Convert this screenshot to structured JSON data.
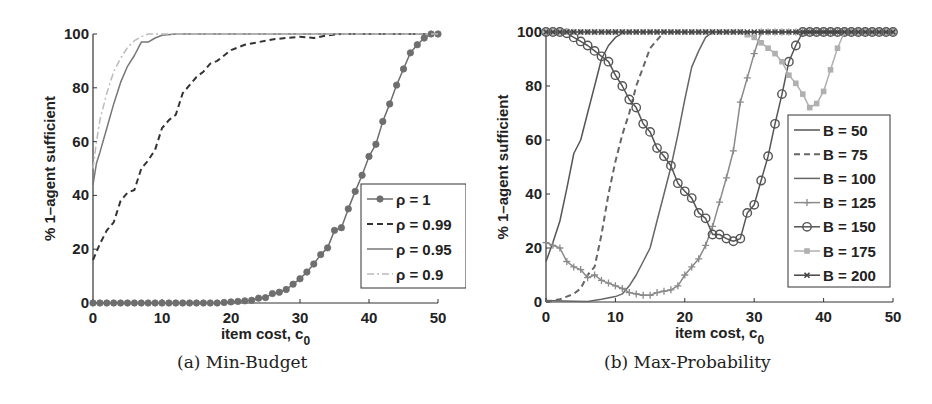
{
  "figure": {
    "panels": [
      {
        "caption": "(a) Min-Budget"
      },
      {
        "caption": "(b) Max-Probability"
      }
    ]
  },
  "chart_data": [
    {
      "type": "line",
      "title": "(a) Min-Budget",
      "xlabel": "item cost, c0",
      "xlabel_main": "item cost, c",
      "xlabel_sub": "0",
      "ylabel": "% 1–agent sufficient",
      "xlim": [
        0,
        50
      ],
      "ylim": [
        0,
        100
      ],
      "xticks": [
        0,
        10,
        20,
        30,
        40,
        50
      ],
      "yticks": [
        0,
        20,
        40,
        60,
        80,
        100
      ],
      "grid": false,
      "legend_position": "lower right",
      "series": [
        {
          "name": "ρ = 1",
          "style": "solid-dot",
          "color": "#6e6e6e",
          "x": [
            0,
            1,
            2,
            3,
            4,
            5,
            6,
            7,
            8,
            9,
            10,
            11,
            12,
            13,
            14,
            15,
            16,
            17,
            18,
            19,
            20,
            21,
            22,
            23,
            24,
            25,
            26,
            27,
            28,
            29,
            30,
            31,
            32,
            33,
            34,
            35,
            36,
            37,
            38,
            39,
            40,
            41,
            42,
            43,
            44,
            45,
            46,
            47,
            48,
            49,
            50
          ],
          "y": [
            0,
            0,
            0,
            0,
            0,
            0,
            0,
            0,
            0,
            0,
            0,
            0,
            0,
            0,
            0,
            0,
            0,
            0,
            0,
            0.2,
            0.4,
            0.6,
            0.8,
            1,
            1.8,
            2,
            3.5,
            4,
            5,
            7,
            9,
            11.5,
            14.5,
            18,
            20.5,
            27,
            28,
            35,
            41.5,
            47.5,
            54.5,
            59,
            67.5,
            74,
            81,
            87,
            93,
            96,
            98.5,
            100,
            100
          ]
        },
        {
          "name": "ρ = 0.99",
          "style": "dashed",
          "color": "#333333",
          "x": [
            0,
            1,
            2,
            3,
            4,
            5,
            6,
            7,
            8,
            9,
            10,
            11,
            12,
            13,
            14,
            15,
            16,
            17,
            18,
            19,
            20,
            22,
            24,
            26,
            28,
            30,
            32,
            34,
            36,
            40,
            45,
            50
          ],
          "y": [
            16,
            22,
            27,
            30,
            38,
            41,
            42,
            50,
            53,
            57,
            65,
            68,
            70,
            78,
            81,
            84,
            86,
            89,
            90,
            92,
            94,
            96,
            97,
            98,
            98.5,
            99,
            98.5,
            99.5,
            100,
            100,
            100,
            100
          ]
        },
        {
          "name": "ρ = 0.95",
          "style": "solid",
          "color": "#777777",
          "x": [
            0,
            0.5,
            1,
            2,
            3,
            4,
            5,
            6,
            7,
            8,
            9,
            10,
            12,
            15,
            20,
            30,
            40,
            50
          ],
          "y": [
            44,
            52,
            56,
            65,
            74,
            82,
            88,
            92,
            97,
            97,
            98.5,
            99.5,
            100,
            100,
            100,
            100,
            100,
            100
          ]
        },
        {
          "name": "ρ = 0.9",
          "style": "dashdot",
          "color": "#bbbbbb",
          "x": [
            0,
            0.5,
            1,
            2,
            3,
            4,
            5,
            6,
            7,
            8,
            9,
            10,
            20,
            30,
            40,
            50
          ],
          "y": [
            50,
            60,
            68,
            78,
            86,
            91,
            95,
            97.5,
            99,
            100,
            100,
            100,
            100,
            100,
            100,
            100
          ]
        }
      ]
    },
    {
      "type": "line",
      "title": "(b) Max-Probability",
      "xlabel": "item cost, c0",
      "xlabel_main": "item cost, c",
      "xlabel_sub": "0",
      "ylabel": "% 1–agent sufficient",
      "xlim": [
        0,
        50
      ],
      "ylim": [
        0,
        100
      ],
      "xticks": [
        0,
        10,
        20,
        30,
        40,
        50
      ],
      "yticks": [
        0,
        20,
        40,
        60,
        80,
        100
      ],
      "grid": false,
      "legend_position": "lower right",
      "series": [
        {
          "name": "B = 50",
          "style": "solid",
          "color": "#555555",
          "x": [
            0,
            1,
            2,
            3,
            4,
            5,
            6,
            7,
            8,
            9,
            10,
            11,
            12,
            14,
            20,
            30,
            40,
            50
          ],
          "y": [
            15,
            22,
            30,
            42,
            55,
            60,
            70,
            80,
            90,
            95,
            98,
            99.5,
            100,
            100,
            100,
            100,
            100,
            100
          ]
        },
        {
          "name": "B = 75",
          "style": "dashed",
          "color": "#666666",
          "x": [
            0,
            1,
            2,
            3,
            4,
            5,
            6,
            7,
            8,
            9,
            10,
            11,
            12,
            13,
            14,
            15,
            16,
            17,
            18,
            20,
            30,
            40,
            50
          ],
          "y": [
            0,
            0.5,
            1,
            2,
            3,
            5,
            10,
            13,
            25,
            40,
            52,
            62,
            70,
            80,
            87,
            94,
            97,
            100,
            100,
            100,
            100,
            100,
            100
          ]
        },
        {
          "name": "B = 100",
          "style": "solid",
          "color": "#666666",
          "x": [
            0,
            4,
            6,
            8,
            10,
            11,
            12,
            13,
            14,
            15,
            16,
            17,
            18,
            19,
            20,
            21,
            22,
            23,
            24,
            25,
            30,
            40,
            50
          ],
          "y": [
            0.5,
            0.3,
            0.2,
            1,
            2,
            3,
            6,
            10,
            15,
            20,
            30,
            40,
            50,
            62,
            75,
            87,
            93,
            98,
            100,
            100,
            100,
            100,
            100
          ]
        },
        {
          "name": "B = 125",
          "style": "solid-plus",
          "color": "#8a8a8a",
          "x": [
            0,
            1,
            2,
            3,
            4,
            5,
            6,
            7,
            8,
            9,
            10,
            11,
            12,
            13,
            14,
            15,
            16,
            17,
            18,
            19,
            20,
            21,
            22,
            23,
            24,
            25,
            26,
            27,
            28,
            29,
            30,
            31,
            32,
            40,
            50
          ],
          "y": [
            22,
            21,
            20,
            15,
            13,
            12,
            9,
            10,
            8,
            7,
            6,
            5,
            3.5,
            3,
            2.5,
            2.5,
            3.5,
            4,
            4.5,
            6,
            10,
            13,
            16,
            21,
            28,
            37,
            46,
            56,
            74,
            83,
            92,
            100,
            100,
            100,
            100
          ]
        },
        {
          "name": "B = 150",
          "style": "solid-circle",
          "color": "#555555",
          "x": [
            0,
            1,
            2,
            3,
            4,
            5,
            6,
            7,
            8,
            9,
            10,
            11,
            12,
            13,
            14,
            15,
            16,
            17,
            18,
            19,
            20,
            21,
            22,
            23,
            24,
            25,
            26,
            27,
            28,
            29,
            30,
            31,
            32,
            33,
            34,
            35,
            36,
            37,
            40,
            45,
            50
          ],
          "y": [
            100,
            100,
            100,
            99.5,
            98,
            96.5,
            95,
            93,
            91,
            89,
            84,
            80,
            75,
            72,
            66,
            63,
            57,
            54,
            50.5,
            44,
            41,
            38.5,
            33,
            31,
            25,
            25,
            23.5,
            22.5,
            23.5,
            33,
            36,
            45,
            54,
            66,
            77,
            89,
            95,
            100,
            100,
            100,
            100
          ]
        },
        {
          "name": "B = 175",
          "style": "solid-square",
          "color": "#b0b0b0",
          "x": [
            0,
            5,
            10,
            15,
            20,
            25,
            28,
            29,
            30,
            31,
            32,
            33,
            34,
            35,
            36,
            37,
            38,
            39,
            40,
            41,
            42,
            43,
            44,
            45,
            50
          ],
          "y": [
            100,
            100,
            100,
            100,
            100,
            100,
            100,
            99,
            98,
            96,
            94,
            92,
            89,
            84,
            81,
            77,
            72,
            73.5,
            78,
            86,
            94,
            100,
            100,
            100,
            100
          ]
        },
        {
          "name": "B = 200",
          "style": "solid-x",
          "color": "#444444",
          "x": [
            0,
            5,
            10,
            15,
            20,
            25,
            30,
            35,
            40,
            45,
            50
          ],
          "y": [
            100,
            100,
            100,
            100,
            100,
            100,
            100,
            100,
            100,
            100,
            100
          ]
        }
      ]
    }
  ]
}
